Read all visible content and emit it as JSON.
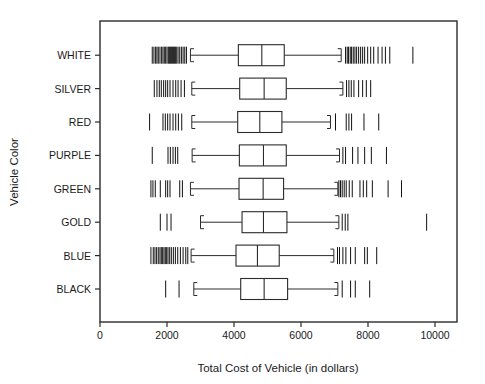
{
  "chart_data": {
    "type": "box",
    "title": "",
    "xlabel": "Total Cost of Vehicle (in dollars)",
    "ylabel": "Vehicle Color",
    "orientation": "horizontal",
    "grid": false,
    "legend": "none",
    "xlim": [
      0,
      10800
    ],
    "xticks": [
      0,
      2000,
      4000,
      6000,
      8000,
      10000
    ],
    "xticklabels": [
      "0",
      "2000",
      "4000",
      "6000",
      "8000",
      "10000"
    ],
    "categories": [
      "WHITE",
      "SILVER",
      "RED",
      "PURPLE",
      "GREEN",
      "GOLD",
      "BLUE",
      "BLACK"
    ],
    "boxes": [
      {
        "category": "WHITE",
        "lower_fence": 2700,
        "q1": 4130,
        "median": 4830,
        "q3": 5500,
        "upper_fence": 7200,
        "outliers": [
          1560,
          1610,
          1660,
          1700,
          1740,
          1790,
          1840,
          1880,
          1920,
          1960,
          2000,
          2040,
          2070,
          2100,
          2130,
          2160,
          2190,
          2220,
          2250,
          2290,
          2330,
          2380,
          2430,
          2480,
          2530,
          2580,
          7330,
          7380,
          7420,
          7470,
          7510,
          7560,
          7610,
          7660,
          7720,
          7780,
          7840,
          7900,
          7990,
          8080,
          8170,
          8300,
          8420,
          8520,
          8650,
          9340
        ]
      },
      {
        "category": "SILVER",
        "lower_fence": 2740,
        "q1": 4170,
        "median": 4900,
        "q3": 5560,
        "upper_fence": 7250,
        "outliers": [
          1620,
          1700,
          1770,
          1830,
          1900,
          1960,
          2020,
          2090,
          2180,
          2260,
          2330,
          2420,
          2520,
          7360,
          7430,
          7500,
          7580,
          7720,
          7840,
          7950,
          8080
        ]
      },
      {
        "category": "RED",
        "lower_fence": 2740,
        "q1": 4110,
        "median": 4770,
        "q3": 5430,
        "upper_fence": 6880,
        "outliers": [
          1480,
          1880,
          1950,
          2020,
          2090,
          2180,
          2260,
          2340,
          2440,
          7030,
          7350,
          7430,
          7510,
          7880,
          8320
        ]
      },
      {
        "category": "PURPLE",
        "lower_fence": 2750,
        "q1": 4160,
        "median": 4880,
        "q3": 5560,
        "upper_fence": 7150,
        "outliers": [
          1560,
          2030,
          2100,
          2180,
          2250,
          2320,
          7250,
          7330,
          7540,
          7700,
          7900,
          8100,
          8550
        ]
      },
      {
        "category": "GREEN",
        "lower_fence": 2700,
        "q1": 4150,
        "median": 4870,
        "q3": 5480,
        "upper_fence": 7100,
        "outliers": [
          1520,
          1580,
          1650,
          1800,
          1960,
          2020,
          2090,
          2380,
          2460,
          7130,
          7180,
          7230,
          7290,
          7350,
          7440,
          7530,
          7760,
          7860,
          7960,
          8130,
          8600,
          9000
        ]
      },
      {
        "category": "GOLD",
        "lower_fence": 3000,
        "q1": 4240,
        "median": 4880,
        "q3": 5580,
        "upper_fence": 7130,
        "outliers": [
          1800,
          2000,
          2120,
          7230,
          7320,
          7400,
          9750
        ]
      },
      {
        "category": "BLUE",
        "lower_fence": 2720,
        "q1": 4060,
        "median": 4700,
        "q3": 5350,
        "upper_fence": 6980,
        "outliers": [
          1520,
          1590,
          1640,
          1690,
          1740,
          1790,
          1830,
          1870,
          1910,
          1950,
          1990,
          2030,
          2080,
          2130,
          2190,
          2250,
          2320,
          2400,
          2480,
          2560,
          2620,
          7090,
          7150,
          7250,
          7340,
          7480,
          7620,
          7900,
          7980,
          8260
        ]
      },
      {
        "category": "BLACK",
        "lower_fence": 2800,
        "q1": 4200,
        "median": 4900,
        "q3": 5600,
        "upper_fence": 7100,
        "outliers": [
          1960,
          2360,
          7230,
          7480,
          7620,
          8050
        ]
      }
    ]
  },
  "axes": {
    "x_title": "Total Cost of Vehicle (in dollars)",
    "y_title": "Vehicle Color",
    "x_tick_labels": [
      "0",
      "2000",
      "4000",
      "6000",
      "8000",
      "10000"
    ],
    "y_tick_labels": [
      "WHITE",
      "SILVER",
      "RED",
      "PURPLE",
      "GREEN",
      "GOLD",
      "BLUE",
      "BLACK"
    ]
  },
  "style": {
    "line_color": "#2b2b2b",
    "rug_color": "#111111",
    "background": "#ffffff"
  }
}
